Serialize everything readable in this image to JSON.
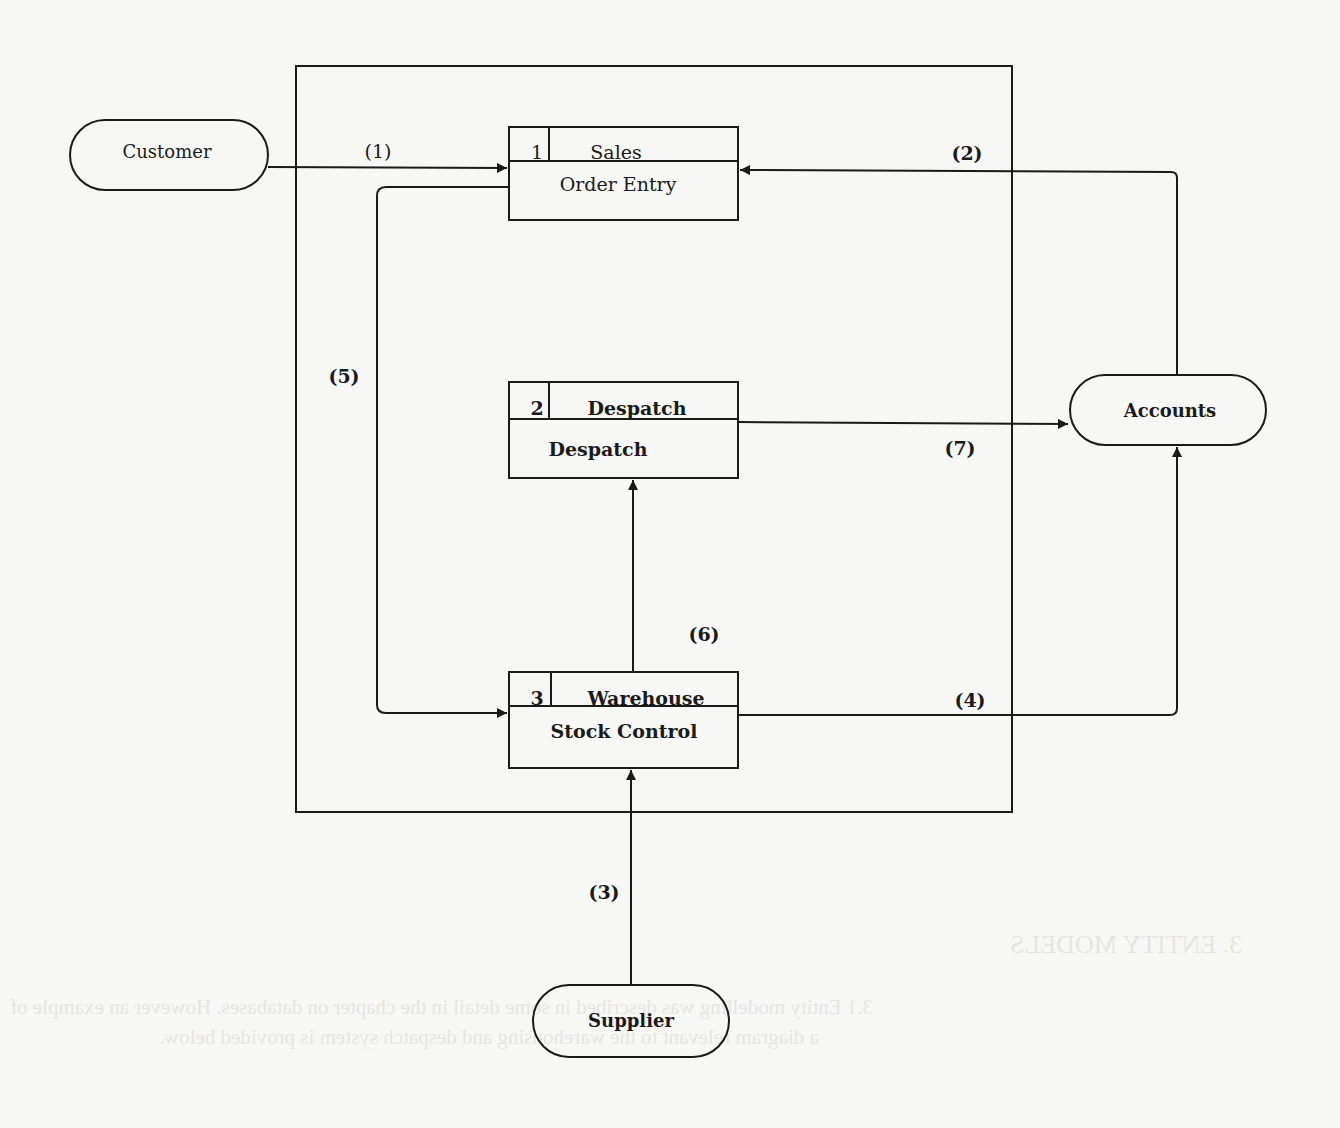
{
  "diagram": {
    "externals": [
      {
        "id": "customer",
        "label": "Customer"
      },
      {
        "id": "accounts",
        "label": "Accounts"
      },
      {
        "id": "supplier",
        "label": "Supplier"
      }
    ],
    "processes": [
      {
        "id": "p1",
        "number": "1",
        "location": "Sales",
        "name": "Order Entry"
      },
      {
        "id": "p2",
        "number": "2",
        "location": "Despatch",
        "name": "Despatch"
      },
      {
        "id": "p3",
        "number": "3",
        "location": "Warehouse",
        "name": "Stock Control"
      }
    ],
    "flows": [
      {
        "label": "(1)",
        "from": "Customer",
        "to": "Order Entry"
      },
      {
        "label": "(2)",
        "from": "Accounts",
        "to": "Order Entry"
      },
      {
        "label": "(3)",
        "from": "Supplier",
        "to": "Stock Control"
      },
      {
        "label": "(4)",
        "from": "Stock Control",
        "to": "Accounts"
      },
      {
        "label": "(5)",
        "from": "Order Entry",
        "to": "Stock Control"
      },
      {
        "label": "(6)",
        "from": "Stock Control",
        "to": "Despatch"
      },
      {
        "label": "(7)",
        "from": "Despatch",
        "to": "Accounts"
      }
    ]
  },
  "bleed_through": {
    "heading": "3. ENTITY MODELS",
    "line1": "3.1 Entity modelling was described in some detail in the chapter on databases. However an example of",
    "line2": "a diagram relevant to the warehousing and despatch system is provided below."
  }
}
